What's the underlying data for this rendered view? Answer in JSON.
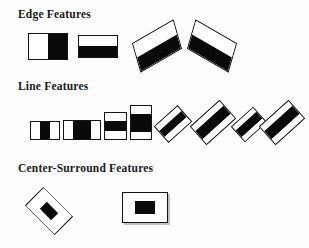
{
  "figure": {
    "kind": "haar-like-feature-prototypes",
    "background_color": "#fdfdfd",
    "fill_dark": "#0a0a0a",
    "fill_light": "#ffffff",
    "stroke_color": "#141414"
  },
  "sections": [
    {
      "id": "edge",
      "title": "Edge Features",
      "features": [
        {
          "name": "edge-vertical-2rect",
          "orientation": "upright",
          "split": "vertical",
          "bands": [
            "white",
            "black"
          ],
          "x": 28,
          "y": 33,
          "w": 40,
          "h": 27,
          "rotation": 0
        },
        {
          "name": "edge-horizontal-2rect",
          "orientation": "upright",
          "split": "horizontal",
          "bands": [
            "white",
            "black"
          ],
          "x": 78,
          "y": 35,
          "w": 40,
          "h": 23,
          "rotation": 0
        },
        {
          "name": "edge-rotated-2rect-left",
          "orientation": "rotated",
          "split": "horizontal",
          "bands": [
            "white",
            "black"
          ],
          "x": 133,
          "y": 33,
          "w": 44,
          "h": 26,
          "rotation": -33
        },
        {
          "name": "edge-rotated-2rect-right",
          "orientation": "rotated",
          "split": "horizontal",
          "bands": [
            "white",
            "black"
          ],
          "x": 188,
          "y": 33,
          "w": 44,
          "h": 26,
          "rotation": 33
        }
      ]
    },
    {
      "id": "line",
      "title": "Line Features",
      "features": [
        {
          "name": "line-vertical-3rect-narrow",
          "orientation": "upright",
          "split": "vertical",
          "bands": [
            "white",
            "black",
            "white"
          ],
          "weights": [
            1,
            1,
            1
          ],
          "x": 30,
          "y": 121,
          "w": 30,
          "h": 19,
          "rotation": 0
        },
        {
          "name": "line-vertical-3rect-wide",
          "orientation": "upright",
          "split": "vertical",
          "bands": [
            "white",
            "black",
            "white"
          ],
          "weights": [
            1,
            2,
            1
          ],
          "x": 63,
          "y": 120,
          "w": 38,
          "h": 20,
          "rotation": 0
        },
        {
          "name": "line-horizontal-3rect-short",
          "orientation": "upright",
          "split": "horizontal",
          "bands": [
            "white",
            "black",
            "white"
          ],
          "weights": [
            1,
            1.5,
            1
          ],
          "x": 104,
          "y": 112,
          "w": 23,
          "h": 28,
          "rotation": 0
        },
        {
          "name": "line-horizontal-3rect-tall",
          "orientation": "upright",
          "split": "horizontal",
          "bands": [
            "white",
            "black",
            "white"
          ],
          "weights": [
            1,
            2.4,
            1
          ],
          "x": 130,
          "y": 105,
          "w": 22,
          "h": 35,
          "rotation": 0
        },
        {
          "name": "line-rotated-3rect-a",
          "orientation": "rotated",
          "split": "horizontal",
          "bands": [
            "white",
            "black",
            "white"
          ],
          "x": 157,
          "y": 113,
          "w": 32,
          "h": 22,
          "rotation": -42
        },
        {
          "name": "line-rotated-3rect-b",
          "orientation": "rotated",
          "split": "horizontal",
          "bands": [
            "white",
            "black",
            "white"
          ],
          "x": 194,
          "y": 110,
          "w": 40,
          "h": 24,
          "rotation": -42
        },
        {
          "name": "line-rotated-3rect-c",
          "orientation": "rotated",
          "split": "horizontal",
          "bands": [
            "white",
            "black",
            "white"
          ],
          "x": 234,
          "y": 114,
          "w": 30,
          "h": 21,
          "rotation": -42
        },
        {
          "name": "line-rotated-3rect-d",
          "orientation": "rotated",
          "split": "horizontal",
          "bands": [
            "white",
            "black",
            "white"
          ],
          "x": 262,
          "y": 110,
          "w": 40,
          "h": 24,
          "rotation": -42
        }
      ]
    },
    {
      "id": "center-surround",
      "title": "Center-Surround Features",
      "features": [
        {
          "name": "center-surround-diamond",
          "orientation": "rotated",
          "shape": "diamond",
          "bands": [
            "white-surround",
            "black-center"
          ],
          "x": 28,
          "y": 190,
          "w": 58,
          "h": 37,
          "rotation": 45
        },
        {
          "name": "center-surround-rectangle",
          "orientation": "upright",
          "shape": "rectangle",
          "bands": [
            "white-surround",
            "black-center"
          ],
          "x": 122,
          "y": 192,
          "w": 46,
          "h": 31,
          "rotation": 0
        }
      ]
    }
  ]
}
